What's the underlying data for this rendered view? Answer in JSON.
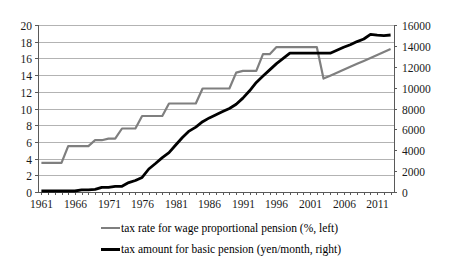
{
  "chart_data": {
    "type": "line",
    "title": "",
    "x": [
      1961,
      1962,
      1963,
      1964,
      1965,
      1966,
      1967,
      1968,
      1969,
      1970,
      1971,
      1972,
      1973,
      1974,
      1975,
      1976,
      1977,
      1978,
      1979,
      1980,
      1981,
      1982,
      1983,
      1984,
      1985,
      1986,
      1987,
      1988,
      1989,
      1990,
      1991,
      1992,
      1993,
      1994,
      1995,
      1996,
      1997,
      1998,
      1999,
      2000,
      2001,
      2002,
      2003,
      2004,
      2005,
      2006,
      2007,
      2008,
      2009,
      2010,
      2011,
      2012,
      2013
    ],
    "x_tick_labels": [
      "1961",
      "1966",
      "1971",
      "1976",
      "1981",
      "1986",
      "1991",
      "1996",
      "2001",
      "2006",
      "2011"
    ],
    "left_axis": {
      "min": 0,
      "max": 20,
      "step": 2,
      "ticks": [
        "0",
        "2",
        "4",
        "6",
        "8",
        "10",
        "12",
        "14",
        "16",
        "18",
        "20"
      ]
    },
    "right_axis": {
      "min": 0,
      "max": 16000,
      "step": 2000,
      "ticks": [
        "0",
        "2000",
        "4000",
        "6000",
        "8000",
        "10000",
        "12000",
        "14000",
        "16000"
      ]
    },
    "grid": "horizontal",
    "legend_position": "bottom",
    "series": [
      {
        "name": "tax rate for wage proportional pension (%, left)",
        "axis": "left",
        "color": "#7f7f7f",
        "values": [
          3.5,
          3.5,
          3.5,
          3.5,
          5.5,
          5.5,
          5.5,
          5.5,
          6.2,
          6.2,
          6.4,
          6.4,
          7.6,
          7.6,
          7.6,
          9.1,
          9.1,
          9.1,
          9.1,
          10.6,
          10.6,
          10.6,
          10.6,
          10.6,
          12.4,
          12.4,
          12.4,
          12.4,
          12.4,
          14.3,
          14.5,
          14.5,
          14.5,
          16.5,
          16.5,
          17.35,
          17.35,
          17.35,
          17.35,
          17.35,
          17.35,
          17.35,
          13.58,
          13.934,
          14.288,
          14.642,
          14.996,
          15.35,
          15.704,
          16.058,
          16.412,
          16.766,
          17.12
        ]
      },
      {
        "name": "tax amount for basic pension (yen/month, right)",
        "axis": "right",
        "color": "#000000",
        "values": [
          100,
          100,
          100,
          100,
          100,
          100,
          200,
          200,
          250,
          450,
          450,
          550,
          550,
          900,
          1100,
          1400,
          2200,
          2730,
          3300,
          3770,
          4500,
          5220,
          5830,
          6220,
          6740,
          7100,
          7400,
          7700,
          8000,
          8400,
          9000,
          9700,
          10500,
          11100,
          11700,
          12300,
          12800,
          13300,
          13300,
          13300,
          13300,
          13300,
          13300,
          13300,
          13580,
          13860,
          14100,
          14410,
          14660,
          15100,
          15020,
          14980,
          15040
        ]
      }
    ]
  },
  "colors": {
    "grid": "#b3b3b3",
    "axis": "#595959",
    "tick_label": "#1a1a1a",
    "background": "#ffffff"
  }
}
